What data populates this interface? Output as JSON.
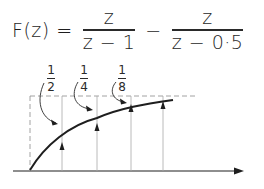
{
  "equation": {
    "lhs": "F(z) =",
    "term1": {
      "numerator": "z",
      "denominator": "z − 1"
    },
    "operator": "−",
    "term2": {
      "numerator": "z",
      "denominator": "z − 0·5"
    }
  },
  "labels": [
    {
      "num": "1",
      "den": "2"
    },
    {
      "num": "1",
      "den": "4"
    },
    {
      "num": "1",
      "den": "8"
    }
  ],
  "colors": {
    "ink": "#1e1e1e",
    "guide": "#9a9a9a"
  }
}
